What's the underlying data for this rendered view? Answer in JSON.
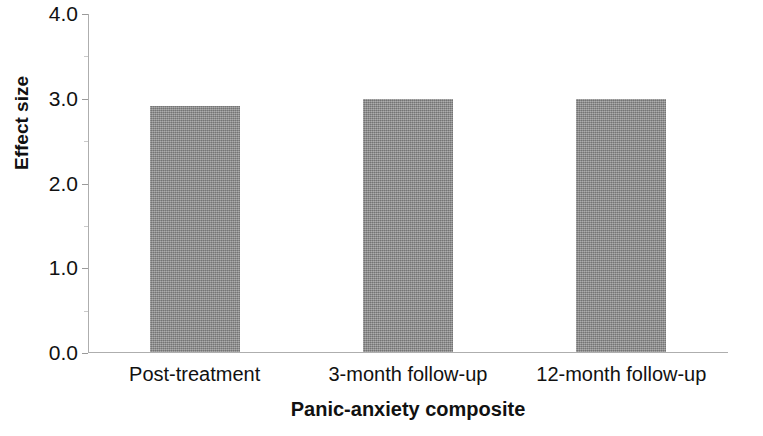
{
  "chart_data": {
    "type": "bar",
    "title": "",
    "categories": [
      "Post-treatment",
      "3-month follow-up",
      "12-month follow-up"
    ],
    "values": [
      2.9,
      2.99,
      2.98
    ],
    "xlabel": "Panic-anxiety composite",
    "ylabel": "Effect size",
    "ylim": [
      0.0,
      4.0
    ],
    "ytick_labels": [
      "0.0",
      "1.0",
      "2.0",
      "3.0",
      "4.0"
    ],
    "ytick_values": [
      0.0,
      1.0,
      2.0,
      3.0,
      4.0
    ],
    "yminor_tick_values": [
      0.5,
      1.5,
      2.5,
      3.5
    ],
    "grid": false,
    "legend": null,
    "bar_color": "#8e8e8e",
    "axis_color": "#aeaeae"
  },
  "axis": {
    "y_title": "Effect size",
    "x_title": "Panic-anxiety composite"
  }
}
